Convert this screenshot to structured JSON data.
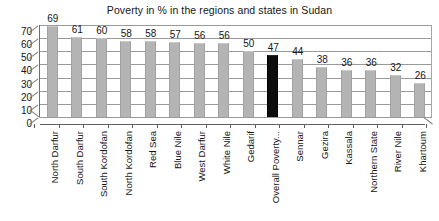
{
  "chart_data": {
    "type": "bar",
    "title": "Poverty in % in the regions and states in Sudan",
    "xlabel": "",
    "ylabel": "",
    "ylim": [
      0,
      70
    ],
    "ytick_labels": [
      "70",
      "60",
      "50",
      "40",
      "30",
      "20",
      "10",
      "0"
    ],
    "ytick_values": [
      70,
      60,
      50,
      40,
      30,
      20,
      10,
      0
    ],
    "grid": true,
    "legend": "none",
    "style_3d": true,
    "bar_color": "#b4b4b4",
    "highlight_color": "#0d0d0d",
    "highlight_category": "Overall Poverty...",
    "categories": [
      "North Darfur",
      "South Darfur",
      "South Kordofan",
      "North Kordofan",
      "Red Sea",
      "Blue Nile",
      "West Darfur",
      "White Nile",
      "Gedarif",
      "Overall Poverty...",
      "Sennar",
      "Gezira",
      "Kassala",
      "Northern State",
      "River Nile",
      "Khartoum"
    ],
    "values": [
      69,
      61,
      60,
      58,
      58,
      57,
      56,
      56,
      50,
      47,
      44,
      38,
      36,
      36,
      32,
      26
    ],
    "data_labels": [
      "69",
      "61",
      "60",
      "58",
      "58",
      "57",
      "56",
      "56",
      "50",
      "47",
      "44",
      "38",
      "36",
      "36",
      "32",
      "26"
    ]
  }
}
